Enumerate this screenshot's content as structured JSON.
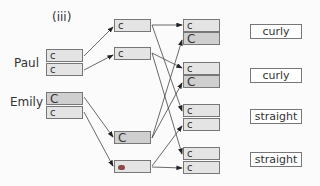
{
  "panel_label": "(iii)",
  "parents": [
    {
      "name": "Paul",
      "alleles": [
        "c",
        "c"
      ]
    },
    {
      "name": "Emily",
      "alleles": [
        "C",
        "c"
      ]
    }
  ],
  "gametes": [
    "c",
    "c",
    "C",
    ""
  ],
  "offspring": [
    {
      "alleles": [
        "c",
        "C"
      ],
      "phenotype": "curly"
    },
    {
      "alleles": [
        "c",
        "C"
      ],
      "phenotype": "curly"
    },
    {
      "alleles": [
        "c",
        "c"
      ],
      "phenotype": "straight"
    },
    {
      "alleles": [
        "c",
        "c"
      ],
      "phenotype": "straight"
    }
  ],
  "colors": {
    "dominant_fill": "#cfcfcf",
    "recessive_fill": "#e4e4e4",
    "line": "#444444"
  }
}
